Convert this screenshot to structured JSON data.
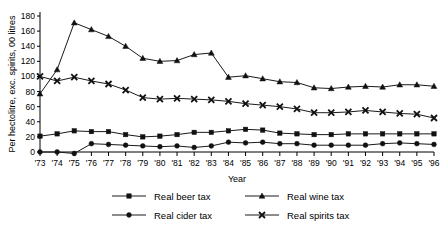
{
  "chart_data": {
    "type": "line",
    "title": "",
    "xlabel": "Year",
    "ylabel": "Per hectolitre, exc. spirits, 00 litres",
    "categories": [
      "'73",
      "'74",
      "'75",
      "'76",
      "'77",
      "'78",
      "'79",
      "'80",
      "'81",
      "'82",
      "'83",
      "'84",
      "'85",
      "'86",
      "'87",
      "'88",
      "'89",
      "'90",
      "'91",
      "'92",
      "'93",
      "'94",
      "'95",
      "'96"
    ],
    "ylim": [
      0,
      180
    ],
    "yticks": [
      0,
      20,
      40,
      60,
      80,
      100,
      120,
      140,
      160,
      180
    ],
    "grid": false,
    "legend_position": "bottom",
    "series": [
      {
        "name": "Real beer tax",
        "marker": "square",
        "values": [
          21,
          24,
          28,
          27,
          27,
          23,
          20,
          21,
          23,
          26,
          26,
          28,
          30,
          29,
          25,
          24,
          23,
          23,
          24,
          24,
          24,
          24,
          24,
          24
        ]
      },
      {
        "name": "Real cider tax",
        "marker": "circle",
        "values": [
          0,
          0,
          -2,
          11,
          10,
          9,
          8,
          7,
          8,
          6,
          8,
          13,
          12,
          13,
          11,
          11,
          9,
          9,
          9,
          9,
          11,
          12,
          11,
          10
        ]
      },
      {
        "name": "Real wine tax",
        "marker": "triangle",
        "values": [
          77,
          109,
          171,
          162,
          153,
          140,
          124,
          120,
          121,
          129,
          131,
          99,
          101,
          97,
          93,
          92,
          85,
          84,
          86,
          87,
          86,
          89,
          89,
          87
        ]
      },
      {
        "name": "Real spirits tax",
        "marker": "cross",
        "values": [
          100,
          94,
          99,
          94,
          90,
          82,
          72,
          70,
          71,
          70,
          69,
          67,
          64,
          62,
          60,
          57,
          52,
          52,
          53,
          55,
          53,
          51,
          50,
          45
        ]
      }
    ]
  },
  "axes": {
    "x_title": "Year",
    "y_title": "Per hectolitre, exc. spirits, 00 litres"
  },
  "legend": {
    "items": [
      {
        "label": "Real beer tax",
        "marker": "square"
      },
      {
        "label": "Real wine tax",
        "marker": "triangle"
      },
      {
        "label": "Real cider tax",
        "marker": "circle"
      },
      {
        "label": "Real spirits tax",
        "marker": "cross"
      }
    ]
  }
}
